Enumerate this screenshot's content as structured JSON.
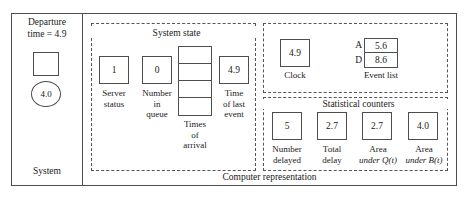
{
  "figure": {
    "system_panel": {
      "caption_line1": "Departure",
      "caption_line2": "time = 4.9",
      "label": "System",
      "server_box_value": "",
      "customer_value": "4.0"
    },
    "computer_panel": {
      "label": "Computer representation",
      "system_state": {
        "title": "System state",
        "variables": [
          {
            "name": "server-status",
            "value": "1",
            "label_line1": "Server",
            "label_line2": "status"
          },
          {
            "name": "number-in-queue",
            "value": "0",
            "label_line1": "Number",
            "label_line2": "in",
            "label_line3": "queue"
          },
          {
            "name": "times-of-arrival",
            "cells": [
              "",
              "",
              "",
              ""
            ],
            "label_line1": "Times",
            "label_line2": "of",
            "label_line3": "arrival"
          },
          {
            "name": "time-of-last-event",
            "value": "4.9",
            "label_line1": "Time",
            "label_line2": "of last",
            "label_line3": "event"
          }
        ]
      },
      "clock_region": {
        "clock": {
          "value": "4.9",
          "label": "Clock"
        },
        "event_list": {
          "label": "Event list",
          "rows": [
            {
              "key": "A",
              "time": "5.6"
            },
            {
              "key": "D",
              "time": "8.6"
            }
          ]
        }
      },
      "statistical_counters": {
        "title": "Statistical counters",
        "variables": [
          {
            "name": "number-delayed",
            "value": "5",
            "label_line1": "Number",
            "label_line2": "delayed"
          },
          {
            "name": "total-delay",
            "value": "2.7",
            "label_line1": "Total",
            "label_line2": "delay"
          },
          {
            "name": "area-under-q",
            "value": "2.7",
            "label_line1": "Area",
            "label_line2": "under Q(t)"
          },
          {
            "name": "area-under-b",
            "value": "4.0",
            "label_line1": "Area",
            "label_line2": "under B(t)"
          }
        ]
      }
    }
  }
}
